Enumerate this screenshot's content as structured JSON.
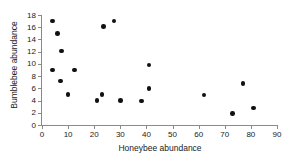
{
  "chart_data": {
    "type": "scatter",
    "title": "",
    "xlabel": "Honeybee abundance",
    "ylabel": "Bumblebee abundance",
    "xlim": [
      0,
      90
    ],
    "ylim": [
      0,
      18
    ],
    "xticks": [
      0,
      10,
      20,
      30,
      40,
      50,
      60,
      70,
      80,
      90
    ],
    "yticks": [
      0,
      2,
      4,
      6,
      8,
      10,
      12,
      14,
      16,
      18
    ],
    "grid": false,
    "legend": null,
    "marker": "filled-circle",
    "marker_color": "#111111",
    "axis_color": "#8a8a8a",
    "points": [
      {
        "x": 4.0,
        "y": 17.0
      },
      {
        "x": 4.0,
        "y": 9.0
      },
      {
        "x": 6.0,
        "y": 15.0
      },
      {
        "x": 7.0,
        "y": 7.2
      },
      {
        "x": 7.5,
        "y": 12.1
      },
      {
        "x": 10.0,
        "y": 5.0
      },
      {
        "x": 12.5,
        "y": 9.0
      },
      {
        "x": 21.0,
        "y": 4.0
      },
      {
        "x": 23.0,
        "y": 5.0
      },
      {
        "x": 23.5,
        "y": 16.1
      },
      {
        "x": 27.5,
        "y": 17.0
      },
      {
        "x": 30.0,
        "y": 4.0
      },
      {
        "x": 38.0,
        "y": 3.9
      },
      {
        "x": 41.0,
        "y": 9.8
      },
      {
        "x": 41.0,
        "y": 6.0
      },
      {
        "x": 62.0,
        "y": 4.9
      },
      {
        "x": 73.0,
        "y": 1.9
      },
      {
        "x": 77.0,
        "y": 6.8
      },
      {
        "x": 81.0,
        "y": 2.8
      }
    ]
  }
}
